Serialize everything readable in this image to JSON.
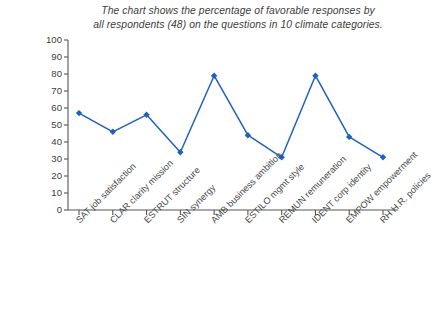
{
  "chart_data": {
    "type": "line",
    "title": "The chart shows the percentage of favorable responses by all respondents (48) on the questions in 10 climate categories.",
    "title_lines": [
      "The chart shows the percentage of favorable responses by",
      "all respondents (48) on the questions in 10 climate categories."
    ],
    "xlabel": "",
    "ylabel": "",
    "ylim": [
      0,
      100
    ],
    "ytick_step": 10,
    "grid": false,
    "legend": "none",
    "series_color": "#2060c0",
    "categories": [
      "SAT job satisfaction",
      "CLAR clarity mission",
      "ESTRUT structure",
      "SIN synergy",
      "AMB business ambition",
      "ESTILO mgmt style",
      "REMUN remuneration",
      "IDENT corp identity",
      "EMPOW empowerment",
      "RH H.R. policies"
    ],
    "values": [
      57,
      46,
      56,
      34,
      79,
      44,
      31,
      79,
      43,
      31
    ],
    "yticks": [
      "0",
      "10",
      "20",
      "30",
      "40",
      "50",
      "60",
      "70",
      "80",
      "90",
      "100"
    ]
  },
  "axes": {
    "y_axis_name": "percentage-axis",
    "x_axis_name": "category-axis"
  }
}
